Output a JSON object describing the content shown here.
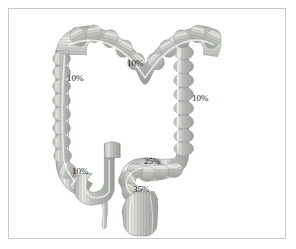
{
  "figure": {
    "background_color": "#ffffff",
    "border_color": "#c8c8c8",
    "organ_fill_color": "#b9bcb8",
    "organ_shade_color": "#9ea29c",
    "organ_highlight_color": "#e4e6e2",
    "label_color": "#1c1c1c"
  },
  "labels": [
    {
      "name": "transverse-colon",
      "value": "10%",
      "x": 126,
      "y": 62
    },
    {
      "name": "descending-colon",
      "value": "10%",
      "x": 66,
      "y": 77
    },
    {
      "name": "ascending-colon",
      "value": "10%",
      "x": 191,
      "y": 97
    },
    {
      "name": "cecum",
      "value": "10%",
      "x": 71,
      "y": 170
    },
    {
      "name": "sigmoid-colon",
      "value": "25%",
      "x": 143,
      "y": 160
    },
    {
      "name": "rectum",
      "value": "35%",
      "x": 132,
      "y": 188
    }
  ],
  "segments": [
    {
      "name": "transverse-colon",
      "label": "Transverse colon"
    },
    {
      "name": "descending-colon",
      "label": "Descending colon"
    },
    {
      "name": "ascending-colon",
      "label": "Ascending colon"
    },
    {
      "name": "cecum",
      "label": "Cecum"
    },
    {
      "name": "appendix",
      "label": "Appendix"
    },
    {
      "name": "ileum",
      "label": "Terminal ileum"
    },
    {
      "name": "sigmoid-colon",
      "label": "Sigmoid colon"
    },
    {
      "name": "rectum",
      "label": "Rectum"
    }
  ]
}
